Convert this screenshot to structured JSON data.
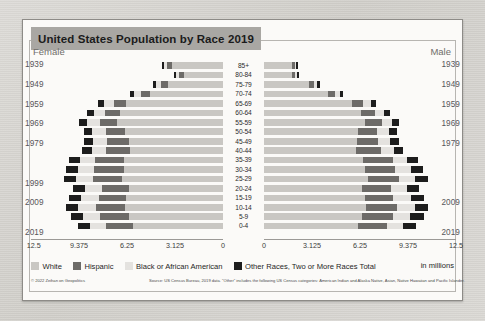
{
  "title": "United States Population by Race 2019",
  "labels": {
    "female": "Female",
    "male": "Male",
    "units": "in millions",
    "copyright": "© 2022 Zeihan on Geopolitics",
    "source": "Source: US Census Bureau, 2019 data. \"Other\" includes the following US Census categories: American Indian and Alaska Native, Asian, Native Hawaiian and Pacific Islander."
  },
  "colors": {
    "white": "#c9c7c3",
    "hispanic": "#6d6b68",
    "black": "#e4e2df",
    "other": "#1d1d1d",
    "title_bg": "#a9a7a3",
    "card_bg": "#fbfaf8",
    "page_bg": "#d8d6d2"
  },
  "legend": [
    {
      "label": "White",
      "color_key": "white"
    },
    {
      "label": "Hispanic",
      "color_key": "hispanic"
    },
    {
      "label": "Black or African American",
      "color_key": "black"
    },
    {
      "label": "Other Races, Two or More Races Total",
      "color_key": "other"
    }
  ],
  "axis": {
    "left_ticks": [
      "12.5",
      "9.375",
      "6.25",
      "3.125",
      "0"
    ],
    "right_ticks": [
      "0",
      "3.125",
      "6.25",
      "9.375",
      "12.5"
    ],
    "max": 12.5
  },
  "birth_years_left": [
    "1939",
    "1949",
    "1959",
    "1969",
    "1979",
    "1999",
    "2009",
    "2019"
  ],
  "birth_years_right": [
    "1939",
    "1949",
    "1959",
    "1969",
    "1979",
    "2009",
    "2019"
  ],
  "chart_data": {
    "type": "bar",
    "subtype": "population-pyramid-stacked",
    "title": "United States Population by Race 2019",
    "xlabel": "in millions",
    "ylabel": "Age group",
    "xlim": [
      0,
      12.5
    ],
    "grid": false,
    "legend_position": "bottom",
    "categories": [
      "85+",
      "80-84",
      "75-79",
      "70-74",
      "65-69",
      "60-64",
      "55-59",
      "50-54",
      "45-49",
      "40-44",
      "35-39",
      "30-34",
      "25-29",
      "20-24",
      "15-19",
      "10-14",
      "5-9",
      "0-4"
    ],
    "series": [
      {
        "name": "White",
        "side": "Female",
        "values": [
          3.35,
          2.55,
          3.6,
          4.75,
          6.3,
          6.7,
          6.9,
          6.35,
          6.15,
          6.05,
          6.45,
          6.45,
          6.6,
          6.15,
          6.3,
          6.35,
          6.1,
          5.85
        ]
      },
      {
        "name": "Hispanic",
        "side": "Female",
        "values": [
          0.28,
          0.3,
          0.42,
          0.58,
          0.82,
          0.98,
          1.12,
          1.25,
          1.42,
          1.6,
          1.88,
          1.92,
          1.85,
          1.75,
          1.8,
          1.92,
          1.9,
          1.8
        ]
      },
      {
        "name": "Black or African American",
        "side": "Female",
        "values": [
          0.22,
          0.22,
          0.32,
          0.45,
          0.62,
          0.75,
          0.85,
          0.9,
          0.88,
          0.9,
          0.98,
          1.05,
          1.12,
          1.1,
          1.12,
          1.15,
          1.1,
          1.02
        ]
      },
      {
        "name": "Other Races, Two or More Races Total",
        "side": "Female",
        "values": [
          0.14,
          0.14,
          0.2,
          0.28,
          0.38,
          0.45,
          0.5,
          0.55,
          0.58,
          0.62,
          0.72,
          0.78,
          0.8,
          0.75,
          0.78,
          0.82,
          0.82,
          0.8
        ]
      },
      {
        "name": "White",
        "side": "Male",
        "values": [
          1.85,
          1.85,
          2.95,
          4.15,
          5.75,
          6.3,
          6.6,
          6.15,
          6.05,
          6.0,
          6.45,
          6.55,
          6.8,
          6.4,
          6.55,
          6.65,
          6.4,
          6.1
        ]
      },
      {
        "name": "Hispanic",
        "side": "Male",
        "values": [
          0.16,
          0.2,
          0.32,
          0.48,
          0.72,
          0.9,
          1.05,
          1.2,
          1.4,
          1.62,
          1.92,
          2.0,
          1.98,
          1.85,
          1.88,
          2.0,
          1.98,
          1.88
        ]
      },
      {
        "name": "Black or African American",
        "side": "Male",
        "values": [
          0.1,
          0.13,
          0.21,
          0.32,
          0.48,
          0.6,
          0.7,
          0.76,
          0.78,
          0.82,
          0.92,
          1.0,
          1.08,
          1.08,
          1.15,
          1.2,
          1.15,
          1.07
        ]
      },
      {
        "name": "Other Races, Two or More Races Total",
        "side": "Male",
        "values": [
          0.08,
          0.1,
          0.15,
          0.22,
          0.32,
          0.4,
          0.46,
          0.52,
          0.56,
          0.62,
          0.72,
          0.8,
          0.82,
          0.78,
          0.82,
          0.86,
          0.86,
          0.84
        ]
      }
    ],
    "year_axis_left": [
      "1939",
      "1949",
      "1959",
      "1969",
      "1979",
      "1999",
      "2009",
      "2019"
    ],
    "year_axis_right": [
      "1939",
      "1949",
      "1959",
      "1969",
      "1979",
      "2009",
      "2019"
    ]
  }
}
